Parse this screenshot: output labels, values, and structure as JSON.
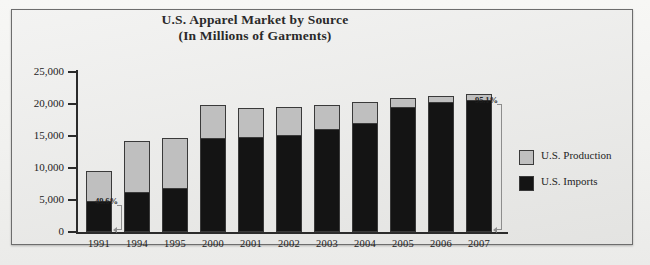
{
  "chart_data": {
    "type": "bar",
    "subtype": "stacked-bar",
    "title": "U.S. Apparel Market by Source",
    "subtitle": "(In Millions of Garments)",
    "xlabel": "",
    "ylabel": "",
    "ylim": [
      0,
      25000
    ],
    "ytick_labels": [
      "25,000",
      "20,000",
      "15,000",
      "10,000",
      "5,000",
      "0"
    ],
    "ytick_values": [
      25000,
      20000,
      15000,
      10000,
      5000,
      0
    ],
    "grid": false,
    "legend_position": "right",
    "categories": [
      "1991",
      "1994",
      "1995",
      "2000",
      "2001",
      "2002",
      "2003",
      "2004",
      "2005",
      "2006",
      "2007"
    ],
    "series": [
      {
        "name": "U.S. Imports",
        "color": "#141414",
        "values": [
          4700,
          6100,
          6700,
          14600,
          14700,
          15000,
          16000,
          16900,
          19400,
          20200,
          20500
        ]
      },
      {
        "name": "U.S. Production",
        "color": "#bfbfbf",
        "values": [
          4800,
          8100,
          8000,
          5200,
          4600,
          4600,
          3800,
          3400,
          1600,
          1000,
          1100
        ]
      }
    ],
    "totals": [
      9500,
      14200,
      14700,
      19800,
      19300,
      19600,
      19800,
      20300,
      21000,
      21200,
      21600
    ],
    "annotations": [
      {
        "label": "49.6%",
        "category": "1991",
        "refers_to": "U.S. Imports"
      },
      {
        "label": "95.1%",
        "category": "2007",
        "refers_to": "U.S. Imports"
      }
    ]
  },
  "legend": {
    "items": [
      {
        "label": "U.S. Production",
        "color": "#bfbfbf"
      },
      {
        "label": "U.S. Imports",
        "color": "#141414"
      }
    ]
  },
  "colors": {
    "production": "#bfbfbf",
    "imports": "#141414",
    "frame": "#6d6d6d",
    "background": "#e9e9e7",
    "text": "#232323"
  }
}
